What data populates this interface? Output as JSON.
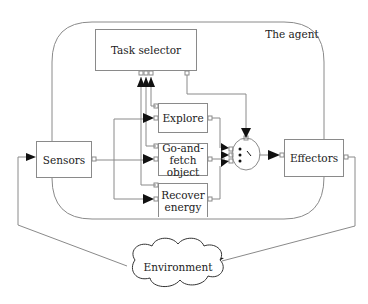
{
  "diagram": {
    "container_label": "The agent",
    "blocks": {
      "task_selector": "Task selector",
      "sensors": "Sensors",
      "effectors": "Effectors",
      "explore": "Explore",
      "go_and_fetch": "Go-and-\nfetch\nobject",
      "go_and_fetch_lines": [
        "Go-and-",
        "fetch",
        "object"
      ],
      "recover_energy_lines": [
        "Recover",
        "energy"
      ],
      "environment": "Environment"
    },
    "colors": {
      "line": "#8a8a8a",
      "arrow": "#111111",
      "text": "#222222"
    }
  }
}
